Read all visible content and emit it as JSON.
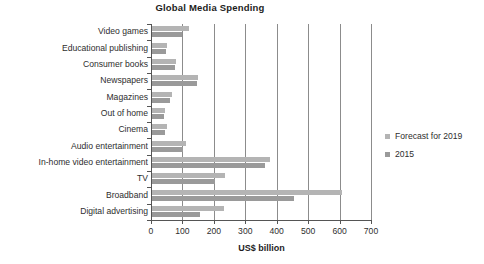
{
  "chart_data": {
    "type": "bar",
    "orientation": "horizontal",
    "title": "Global Media Spending",
    "xlabel": "US$ billion",
    "ylabel": "",
    "xlim": [
      0,
      700
    ],
    "xticks": [
      0,
      100,
      200,
      300,
      400,
      500,
      600,
      700
    ],
    "grid": "vertical",
    "legend_position": "right",
    "categories": [
      "Video games",
      "Educational publishing",
      "Consumer books",
      "Newspapers",
      "Magazines",
      "Out of home",
      "Cinema",
      "Audio entertainment",
      "In-home video entertainment",
      "TV",
      "Broadband",
      "Digital advertising"
    ],
    "series": [
      {
        "name": "Forecast for 2019",
        "color": "#b4b4b4",
        "values": [
          118,
          47,
          76,
          147,
          63,
          40,
          47,
          107,
          377,
          232,
          605,
          229
        ]
      },
      {
        "name": "2015",
        "color": "#9a9a9a",
        "values": [
          95,
          44,
          72,
          142,
          58,
          37,
          40,
          100,
          361,
          202,
          453,
          154
        ]
      }
    ]
  },
  "legend": {
    "entries": [
      {
        "label": "Forecast for 2019",
        "color": "#b4b4b4"
      },
      {
        "label": "2015",
        "color": "#9a9a9a"
      }
    ]
  },
  "axis": {
    "x_title": "US$ billion",
    "tick_labels": [
      "0",
      "100",
      "200",
      "300",
      "400",
      "500",
      "600",
      "700"
    ]
  }
}
